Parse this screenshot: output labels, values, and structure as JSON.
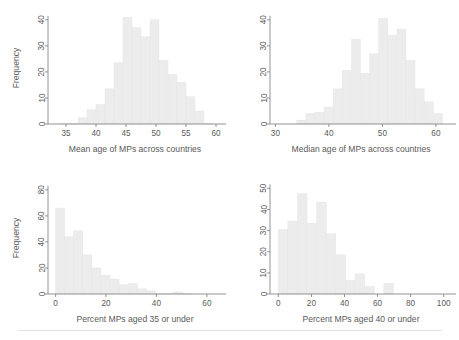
{
  "figure": {
    "title": "",
    "background": "#ffffff",
    "bar_color": "#ececec",
    "axis_color": "#7a7a7a",
    "text_color": "#5a5a5a",
    "panel_count": 4
  },
  "chart_data": [
    {
      "id": "mean-age",
      "position": "top-left",
      "type": "bar",
      "title": "",
      "xlabel": "Mean age of MPs across countries",
      "ylabel": "Frequency",
      "xlim": [
        32,
        61
      ],
      "ylim": [
        0,
        43
      ],
      "xticks": [
        35,
        40,
        45,
        50,
        55,
        60
      ],
      "yticks": [
        0,
        10,
        20,
        30,
        40
      ],
      "grid": false,
      "legend": "none",
      "bin_width": 1.5,
      "bin_starts": [
        34.0,
        35.5,
        37.0,
        38.5,
        40.0,
        41.5,
        43.0,
        44.5,
        46.0,
        47.5,
        49.0,
        50.5,
        52.0,
        53.5,
        55.0,
        56.5,
        58.0
      ],
      "categories": [
        "34.0",
        "35.5",
        "37.0",
        "38.5",
        "40.0",
        "41.5",
        "43.0",
        "44.5",
        "46.0",
        "47.5",
        "49.0",
        "50.5",
        "52.0",
        "53.5",
        "55.0",
        "56.5",
        "58.0"
      ],
      "values": [
        0.3,
        0.3,
        2.5,
        5.5,
        7.5,
        13.5,
        23.5,
        41,
        37,
        33.5,
        40,
        24.5,
        19,
        16,
        10.5,
        5,
        0.3
      ]
    },
    {
      "id": "median-age",
      "position": "top-right",
      "type": "bar",
      "title": "",
      "xlabel": "Median age of MPs across countries",
      "ylabel": "",
      "xlim": [
        29,
        63
      ],
      "ylim": [
        0,
        43
      ],
      "xticks": [
        30,
        40,
        50,
        60
      ],
      "yticks": [
        0,
        10,
        20,
        30,
        40
      ],
      "grid": false,
      "legend": "none",
      "bin_width": 1.7,
      "bin_starts": [
        34.0,
        35.7,
        37.4,
        39.1,
        40.8,
        42.5,
        44.2,
        45.9,
        47.6,
        49.3,
        51.0,
        52.7,
        54.4,
        56.1,
        57.8,
        59.5
      ],
      "categories": [
        "34.0",
        "35.7",
        "37.4",
        "39.1",
        "40.8",
        "42.5",
        "44.2",
        "45.9",
        "47.6",
        "49.3",
        "51.0",
        "52.7",
        "54.4",
        "56.1",
        "57.8",
        "59.5"
      ],
      "values": [
        1.5,
        4,
        4.5,
        6.5,
        13.5,
        20.5,
        32.5,
        19.5,
        27,
        40.5,
        34,
        36.5,
        24.5,
        13.5,
        8.5,
        4
      ]
    },
    {
      "id": "percent-35-under",
      "position": "bottom-left",
      "type": "bar",
      "title": "",
      "xlabel": "Percent MPs aged 35 or under",
      "ylabel": "Frequency",
      "xlim": [
        -3,
        66
      ],
      "ylim": [
        0,
        86
      ],
      "xticks": [
        0,
        20,
        40,
        60
      ],
      "yticks": [
        0,
        20,
        40,
        60,
        80
      ],
      "grid": false,
      "legend": "none",
      "bin_width": 3.6,
      "bin_starts": [
        0.0,
        3.6,
        7.2,
        10.8,
        14.4,
        18.0,
        21.6,
        25.2,
        28.8,
        32.4,
        36.0,
        39.6,
        43.2,
        46.8,
        50.4
      ],
      "categories": [
        "0.0",
        "3.6",
        "7.2",
        "10.8",
        "14.4",
        "18.0",
        "21.6",
        "25.2",
        "28.8",
        "32.4",
        "36.0",
        "39.6",
        "43.2",
        "46.8",
        "50.4"
      ],
      "values": [
        66,
        44,
        48.5,
        30,
        20,
        14.5,
        11.5,
        7,
        8,
        4,
        2.5,
        0.3,
        0.3,
        1.5,
        0.3
      ]
    },
    {
      "id": "percent-40-under",
      "position": "bottom-right",
      "type": "bar",
      "title": "",
      "xlabel": "Percent MPs aged 40 or under",
      "ylabel": "",
      "xlim": [
        -5,
        105
      ],
      "ylim": [
        0,
        53
      ],
      "xticks": [
        0,
        20,
        40,
        60,
        80,
        100
      ],
      "yticks": [
        0,
        10,
        20,
        30,
        40,
        50
      ],
      "grid": false,
      "legend": "none",
      "bin_width": 5.8,
      "bin_starts": [
        0.0,
        5.8,
        11.6,
        17.4,
        23.2,
        29.0,
        34.8,
        40.6,
        46.4,
        52.2,
        58.0,
        63.8,
        69.6
      ],
      "categories": [
        "0.0",
        "5.8",
        "11.6",
        "17.4",
        "23.2",
        "29.0",
        "34.8",
        "40.6",
        "46.4",
        "52.2",
        "58.0",
        "63.8",
        "69.6"
      ],
      "values": [
        30.5,
        34.5,
        47.5,
        33.5,
        43.5,
        28.5,
        18.5,
        6.5,
        9.5,
        3.5,
        0,
        5,
        0
      ]
    }
  ]
}
